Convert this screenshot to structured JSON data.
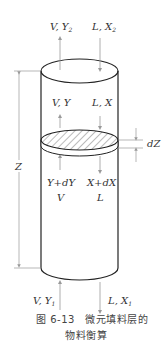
{
  "figure": {
    "top_labels": {
      "gas_out": "V, Y",
      "gas_out_sub": "2",
      "liquid_in": "L, X",
      "liquid_in_sub": "2"
    },
    "mid_upper_labels": {
      "gas": "V, Y",
      "liquid": "L, X"
    },
    "mid_lower_labels": {
      "gas_comp": "Y+dY",
      "liquid_comp": "X+dX",
      "gas_flow": "V",
      "liquid_flow": "L"
    },
    "bottom_labels": {
      "gas_in": "V, Y",
      "gas_in_sub": "1",
      "liquid_out": "L, X",
      "liquid_out_sub": "1"
    },
    "dimensions": {
      "height": "Z",
      "element_height": "dZ"
    },
    "caption": {
      "line1": "图 6-13　微元填料层的",
      "line2": "物料衡算"
    },
    "colors": {
      "outline": "#222222",
      "arrow": "#9a9a9a",
      "hatch": "#555555",
      "text": "#333333"
    }
  }
}
